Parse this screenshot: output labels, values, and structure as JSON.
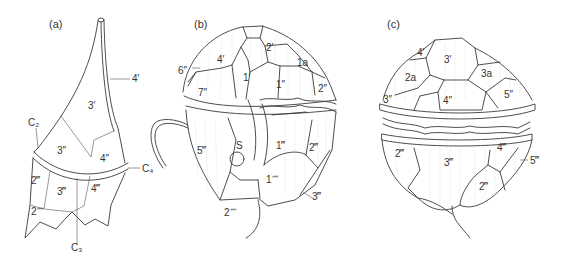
{
  "figure": {
    "panels": [
      {
        "id": "a",
        "label": "(a)",
        "plates": [
          "3′",
          "4′",
          "3″",
          "4″",
          "2‴",
          "3‴",
          "4‴",
          "2⁗"
        ],
        "callouts": [
          "4′",
          "C₂",
          "C₃",
          "C₄"
        ]
      },
      {
        "id": "b",
        "label": "(b)",
        "plates": [
          "4′",
          "2′",
          "1a",
          "1′",
          "1″",
          "2″",
          "6″",
          "7″",
          "5‴",
          "S",
          "1‴",
          "2‴",
          "1⁗",
          "3‴",
          "2⁗"
        ],
        "callouts": [
          "6″",
          "3‴",
          "2⁗"
        ]
      },
      {
        "id": "c",
        "label": "(c)",
        "plates": [
          "4′",
          "3′",
          "2a",
          "3a",
          "3″",
          "4″",
          "5″",
          "2‴",
          "3‴",
          "4‴",
          "2‴",
          "5‴"
        ],
        "callouts": [
          "5‴"
        ]
      }
    ]
  },
  "labels": {
    "a": {
      "panel": "(a)",
      "p4p": "4′",
      "p3p": "3′",
      "c2": "C₂",
      "p3pp": "3″",
      "p4pp": "4″",
      "c4": "C₄",
      "p2ppp": "2‴",
      "p3ppp": "3‴",
      "p4ppp": "4‴",
      "p2pppp": "2⁗",
      "c3": "C₃"
    },
    "b": {
      "panel": "(b)",
      "p2p": "2′",
      "p4p": "4′",
      "p1a": "1a",
      "p6pp": "6″",
      "p1p": "1′",
      "p1pp": "1″",
      "p2pp": "2″",
      "p7pp": "7″",
      "p5ppp": "5‴",
      "s": "S",
      "p1ppp": "1‴",
      "p2ppp": "2‴",
      "p1pppp": "1⁗",
      "p3ppp": "3‴",
      "p2pppp": "2⁗"
    },
    "c": {
      "panel": "(c)",
      "p4p": "4′",
      "p3p": "3′",
      "p2a": "2a",
      "p3a": "3a",
      "p3pp": "3″",
      "p4pp": "4″",
      "p5pp": "5″",
      "p2ppp_left": "2‴",
      "p3ppp": "3‴",
      "p4ppp": "4‴",
      "p5ppp": "5‴",
      "p2ppp_right": "2‴"
    }
  }
}
